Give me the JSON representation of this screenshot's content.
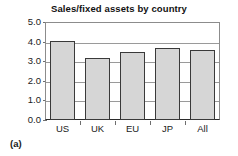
{
  "chart_data": {
    "type": "bar",
    "title": "Sales/fixed assets by country",
    "categories": [
      "US",
      "UK",
      "EU",
      "JP",
      "All"
    ],
    "values": [
      4.05,
      3.15,
      3.45,
      3.65,
      3.55
    ],
    "xlabel": "",
    "ylabel": "",
    "ylim": [
      0.0,
      5.0
    ],
    "ytick_labels": [
      "0.0",
      "1.0",
      "2.0",
      "3.0",
      "4.0",
      "5.0"
    ],
    "ytick_values": [
      0.0,
      1.0,
      2.0,
      3.0,
      4.0,
      5.0
    ],
    "grid": true,
    "legend": false,
    "bar_color": "#d6d6d6",
    "bar_edge_color": "#3a3a3a",
    "grid_color": "#9a9a9a",
    "axis_color": "#2b2b2b"
  },
  "figure": {
    "panel_label": "(a)"
  }
}
